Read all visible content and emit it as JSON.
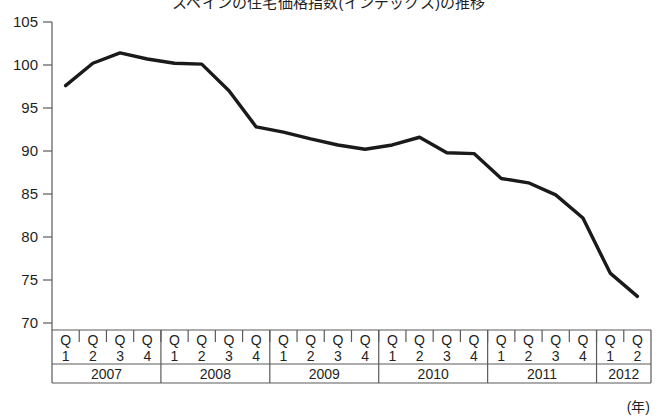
{
  "title": "スペインの住宅価格指数(インデックス)の推移",
  "axis": {
    "unit_label": "(年)",
    "y_ticks": [
      105,
      100,
      95,
      90,
      85,
      80,
      75,
      70
    ]
  },
  "chart_data": {
    "type": "line",
    "title": "スペインの住宅価格指数(インデックス)の推移",
    "xlabel": "(年)",
    "ylabel": "",
    "ylim": [
      70,
      105
    ],
    "grid": false,
    "legend": null,
    "categories": [
      "2007 Q1",
      "2007 Q2",
      "2007 Q3",
      "2007 Q4",
      "2008 Q1",
      "2008 Q2",
      "2008 Q3",
      "2008 Q4",
      "2009 Q1",
      "2009 Q2",
      "2009 Q3",
      "2009 Q4",
      "2010 Q1",
      "2010 Q2",
      "2010 Q3",
      "2010 Q4",
      "2011 Q1",
      "2011 Q2",
      "2011 Q3",
      "2011 Q4",
      "2012 Q1",
      "2012 Q2"
    ],
    "quarter_labels": [
      "Q1",
      "Q2",
      "Q3",
      "Q4",
      "Q1",
      "Q2",
      "Q3",
      "Q4",
      "Q1",
      "Q2",
      "Q3",
      "Q4",
      "Q1",
      "Q2",
      "Q3",
      "Q4",
      "Q1",
      "Q2",
      "Q3",
      "Q4",
      "Q1",
      "Q2"
    ],
    "year_groups": [
      {
        "label": "2007",
        "start": 0,
        "count": 4
      },
      {
        "label": "2008",
        "start": 4,
        "count": 4
      },
      {
        "label": "2009",
        "start": 8,
        "count": 4
      },
      {
        "label": "2010",
        "start": 12,
        "count": 4
      },
      {
        "label": "2011",
        "start": 16,
        "count": 4
      },
      {
        "label": "2012",
        "start": 20,
        "count": 2
      }
    ],
    "values": [
      97.6,
      100.2,
      101.4,
      100.7,
      100.2,
      100.1,
      97.0,
      92.8,
      92.2,
      91.4,
      90.7,
      90.2,
      90.7,
      91.6,
      89.8,
      89.7,
      86.8,
      86.3,
      84.9,
      82.2,
      75.8,
      73.1
    ],
    "series_color": "#1a1a1a"
  }
}
